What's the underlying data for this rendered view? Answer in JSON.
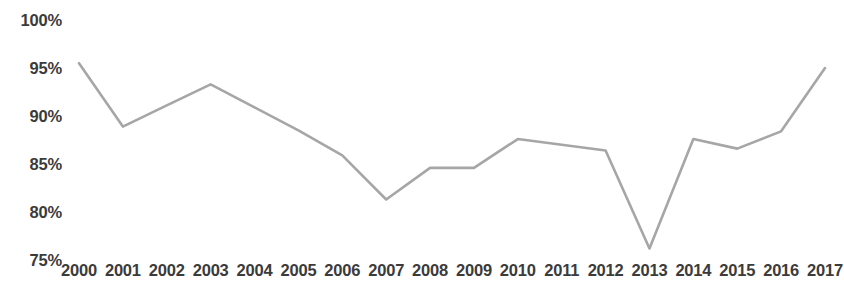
{
  "chart_data": {
    "type": "line",
    "title": "",
    "subtitle": "",
    "xlabel": "",
    "ylabel": "",
    "grid": false,
    "legend": false,
    "legend_position": "none",
    "line_color": "#a6a6a6",
    "background_color": "#ffffff",
    "text_color": "#3b3b3b",
    "x": [
      2000,
      2001,
      2002,
      2003,
      2004,
      2005,
      2006,
      2007,
      2008,
      2009,
      2010,
      2011,
      2012,
      2013,
      2014,
      2015,
      2016,
      2017
    ],
    "categories": [
      "2000",
      "2001",
      "2002",
      "2003",
      "2004",
      "2005",
      "2006",
      "2007",
      "2008",
      "2009",
      "2010",
      "2011",
      "2012",
      "2013",
      "2014",
      "2015",
      "2016",
      "2017"
    ],
    "values": [
      95.5,
      88.9,
      91.1,
      93.3,
      90.9,
      88.5,
      85.9,
      81.3,
      84.6,
      84.6,
      87.6,
      87.0,
      86.4,
      76.2,
      87.6,
      86.6,
      88.4,
      95.0
    ],
    "ylim": [
      75,
      100
    ],
    "ytick_values": [
      100,
      95,
      90,
      85,
      80,
      75
    ],
    "ytick_labels": [
      "100%",
      "95%",
      "90%",
      "85%",
      "80%",
      "75%"
    ],
    "xtick_labels": [
      "2000",
      "2001",
      "2002",
      "2003",
      "2004",
      "2005",
      "2006",
      "2007",
      "2008",
      "2009",
      "2010",
      "2011",
      "2012",
      "2013",
      "2014",
      "2015",
      "2016",
      "2017"
    ],
    "annotations": []
  }
}
